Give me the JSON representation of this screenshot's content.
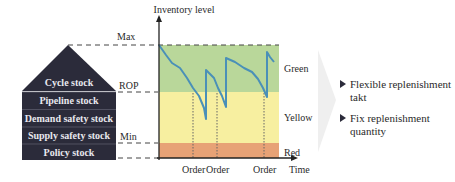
{
  "diagram": {
    "y_axis_label": "Inventory level",
    "x_axis_label": "Time",
    "levels": {
      "max": "Max",
      "rop": "ROP",
      "min": "Min"
    },
    "zones": [
      {
        "name": "Green",
        "color": "#b9d79a"
      },
      {
        "name": "Yellow",
        "color": "#f7efa0"
      },
      {
        "name": "Red",
        "color": "#e7a276"
      }
    ],
    "order_labels": [
      "Order",
      "Order",
      "Order"
    ],
    "line_color": "#4a90b8",
    "house": {
      "color": "#2b2b3a",
      "layers": [
        "Cycle stock",
        "Pipeline stock",
        "Demand safety stock",
        "Supply safety stock",
        "Policy stock"
      ]
    },
    "bullets": [
      "Flexible replenishment takt",
      "Fix replenishment quantity"
    ]
  }
}
